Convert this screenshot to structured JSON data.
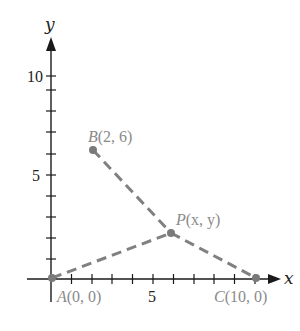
{
  "diagram": {
    "type": "coordinate-geometry",
    "axes": {
      "x_label": "x",
      "y_label": "y",
      "x_tick_labels": [
        {
          "value": 5,
          "text": "5"
        }
      ],
      "y_tick_labels": [
        {
          "value": 5,
          "text": "5"
        },
        {
          "value": 10,
          "text": "10"
        }
      ],
      "x_ticks": [
        1,
        2,
        3,
        4,
        5,
        6,
        7,
        8,
        9,
        10
      ],
      "y_ticks": [
        1,
        2,
        3,
        4,
        5,
        6,
        7,
        8,
        9,
        10
      ]
    },
    "points": [
      {
        "id": "A",
        "name": "A",
        "coords": "(0, 0)",
        "x": 0,
        "y": 0
      },
      {
        "id": "B",
        "name": "B",
        "coords": "(2, 6)",
        "x": 2,
        "y": 6
      },
      {
        "id": "C",
        "name": "C",
        "coords": "(10, 0)",
        "x": 10,
        "y": 0
      },
      {
        "id": "P",
        "name": "P",
        "coords": "(x, y)",
        "x": 6,
        "y": 2.2
      }
    ],
    "segments": [
      {
        "from": "A",
        "to": "P",
        "style": "dashed"
      },
      {
        "from": "B",
        "to": "P",
        "style": "dashed"
      },
      {
        "from": "P",
        "to": "C",
        "style": "dashed"
      }
    ],
    "colors": {
      "axis": "#1a1a1a",
      "segment": "#808080",
      "point": "#7a7a7a",
      "point_label": "#8a8a8a"
    }
  }
}
